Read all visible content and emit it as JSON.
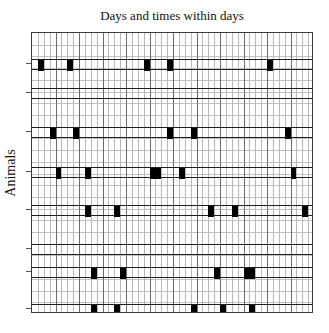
{
  "chart_data": {
    "type": "heatmap",
    "title": "Days and times within days",
    "xlabel": "Days and times within days",
    "ylabel": "Animals",
    "grid": true,
    "legend": "none",
    "x_axis": {
      "n_columns": 48,
      "n_days": 12,
      "times_per_day": 4,
      "tick_labels": [],
      "range": [
        0,
        48
      ]
    },
    "y_axis": {
      "n_animals": 8,
      "categories": [
        "1",
        "2",
        "3",
        "4",
        "5",
        "6",
        "7",
        "8"
      ],
      "tick_labels": [],
      "range": [
        0,
        8
      ]
    },
    "encoding": {
      "filled_cell_color": "#000000",
      "empty_cell_color": "#ffffff",
      "description": "Each row is one animal; black cells mark time bins in which an event occurred."
    },
    "rows": [
      {
        "animal": "1",
        "band_y": 58,
        "events": [
          {
            "col": 1,
            "span": 1
          },
          {
            "col": 6,
            "span": 1
          },
          {
            "col": 19,
            "span": 1
          },
          {
            "col": 23,
            "span": 1
          },
          {
            "col": 40,
            "span": 1
          }
        ]
      },
      {
        "animal": "2",
        "band_y": 87,
        "events": []
      },
      {
        "animal": "3",
        "band_y": 126,
        "events": [
          {
            "col": 3,
            "span": 1
          },
          {
            "col": 7,
            "span": 1
          },
          {
            "col": 23,
            "span": 1
          },
          {
            "col": 27,
            "span": 1
          },
          {
            "col": 43,
            "span": 1
          }
        ]
      },
      {
        "animal": "4",
        "band_y": 166,
        "events": [
          {
            "col": 4,
            "span": 1
          },
          {
            "col": 9,
            "span": 1
          },
          {
            "col": 20,
            "span": 2
          },
          {
            "col": 25,
            "span": 1
          },
          {
            "col": 44,
            "span": 1
          }
        ]
      },
      {
        "animal": "5",
        "band_y": 204,
        "events": [
          {
            "col": 9,
            "span": 1
          },
          {
            "col": 14,
            "span": 1
          },
          {
            "col": 30,
            "span": 1
          },
          {
            "col": 34,
            "span": 1
          },
          {
            "col": 46,
            "span": 1
          }
        ]
      },
      {
        "animal": "6",
        "band_y": 243,
        "events": []
      },
      {
        "animal": "7",
        "band_y": 266,
        "events": [
          {
            "col": 10,
            "span": 1
          },
          {
            "col": 15,
            "span": 1
          },
          {
            "col": 31,
            "span": 1
          },
          {
            "col": 36,
            "span": 2
          }
        ]
      },
      {
        "animal": "8",
        "band_y": 303,
        "events": [
          {
            "col": 10,
            "span": 1
          },
          {
            "col": 14,
            "span": 1
          },
          {
            "col": 27,
            "span": 1
          },
          {
            "col": 32,
            "span": 1
          },
          {
            "col": 37,
            "span": 1
          }
        ]
      }
    ]
  }
}
